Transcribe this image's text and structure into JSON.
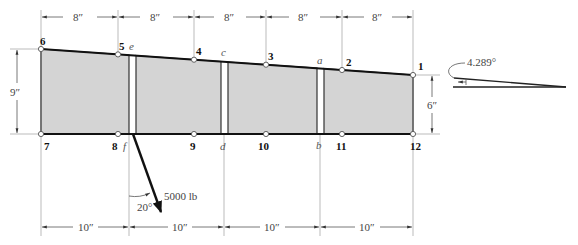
{
  "figure": {
    "nodes_top": [
      {
        "id": "6",
        "label": "6"
      },
      {
        "id": "5",
        "label": "5"
      },
      {
        "id": "4",
        "label": "4"
      },
      {
        "id": "3",
        "label": "3"
      },
      {
        "id": "2",
        "label": "2"
      },
      {
        "id": "1",
        "label": "1"
      }
    ],
    "nodes_bottom": [
      {
        "id": "7",
        "label": "7"
      },
      {
        "id": "8",
        "label": "8"
      },
      {
        "id": "9",
        "label": "9"
      },
      {
        "id": "10",
        "label": "10"
      },
      {
        "id": "11",
        "label": "11"
      },
      {
        "id": "12",
        "label": "12"
      }
    ],
    "gap_labels": {
      "e": "e",
      "f": "f",
      "c": "c",
      "d": "d",
      "a": "a",
      "b": "b"
    },
    "top_dimensions": [
      "8″",
      "8″",
      "8″",
      "8″",
      "8″"
    ],
    "bottom_dimensions": [
      "10″",
      "10″",
      "10″",
      "10″"
    ],
    "left_height": "9″",
    "right_height": "6″",
    "load": {
      "magnitude": "5000 lb",
      "angle": "20°"
    },
    "taper_angle": "4.289°",
    "colors": {
      "panel_fill": "#d4d4d4",
      "outline": "#222222",
      "dim_line": "#999999"
    }
  }
}
